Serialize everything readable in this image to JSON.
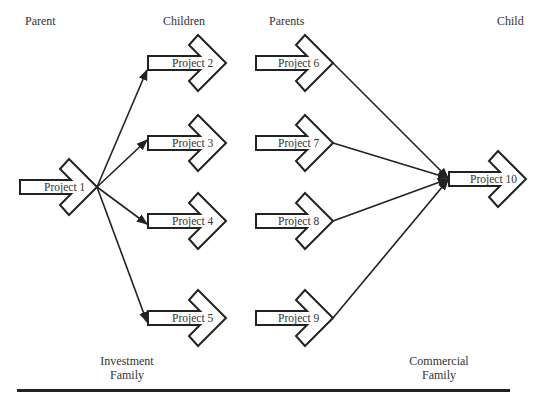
{
  "headings": {
    "parent": "Parent",
    "children": "Children",
    "parents": "Parents",
    "child": "Child"
  },
  "families": {
    "investment": {
      "line1": "Investment",
      "line2": "Family"
    },
    "commercial": {
      "line1": "Commercial",
      "line2": "Family"
    }
  },
  "projects": [
    {
      "id": 1,
      "label": "Project 1",
      "role": "parent",
      "family": "Investment"
    },
    {
      "id": 2,
      "label": "Project 2",
      "role": "child",
      "family": "Investment"
    },
    {
      "id": 3,
      "label": "Project 3",
      "role": "child",
      "family": "Investment"
    },
    {
      "id": 4,
      "label": "Project 4",
      "role": "child",
      "family": "Investment"
    },
    {
      "id": 5,
      "label": "Project 5",
      "role": "child",
      "family": "Investment"
    },
    {
      "id": 6,
      "label": "Project 6",
      "role": "parent",
      "family": "Commercial"
    },
    {
      "id": 7,
      "label": "Project 7",
      "role": "parent",
      "family": "Commercial"
    },
    {
      "id": 8,
      "label": "Project 8",
      "role": "parent",
      "family": "Commercial"
    },
    {
      "id": 9,
      "label": "Project 9",
      "role": "parent",
      "family": "Commercial"
    },
    {
      "id": 10,
      "label": "Project 10",
      "role": "child",
      "family": "Commercial"
    }
  ],
  "links": [
    {
      "from": "Project 1",
      "to": "Project 2"
    },
    {
      "from": "Project 1",
      "to": "Project 3"
    },
    {
      "from": "Project 1",
      "to": "Project 4"
    },
    {
      "from": "Project 1",
      "to": "Project 5"
    },
    {
      "from": "Project 6",
      "to": "Project 10"
    },
    {
      "from": "Project 7",
      "to": "Project 10"
    },
    {
      "from": "Project 8",
      "to": "Project 10"
    },
    {
      "from": "Project 9",
      "to": "Project 10"
    }
  ],
  "colors": {
    "stroke": "#222222",
    "fill": "#ffffff",
    "text": "#333333"
  }
}
